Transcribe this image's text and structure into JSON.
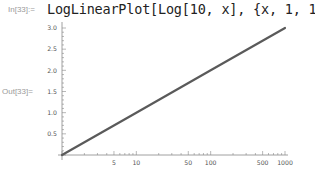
{
  "notebook": {
    "input_label": "In[33]:=",
    "input_code": "LogLinearPlot[Log[10, x], {x, 1, 1000}]",
    "output_label": "Out[33]="
  },
  "chart_data": {
    "type": "line",
    "title": "",
    "xlabel": "",
    "ylabel": "",
    "x_scale": "log",
    "xlim": [
      1,
      1000
    ],
    "ylim": [
      0,
      3.0
    ],
    "x_tick_labels": [
      "5",
      "10",
      "50",
      "100",
      "500",
      "1000"
    ],
    "y_tick_labels": [
      "0.5",
      "1.0",
      "1.5",
      "2.0",
      "2.5",
      "3.0"
    ],
    "grid": false,
    "series": [
      {
        "name": "Log[10, x]",
        "color": "#5a5a5a",
        "x": [
          1,
          10,
          100,
          1000
        ],
        "y": [
          0,
          1,
          2,
          3
        ]
      }
    ]
  }
}
